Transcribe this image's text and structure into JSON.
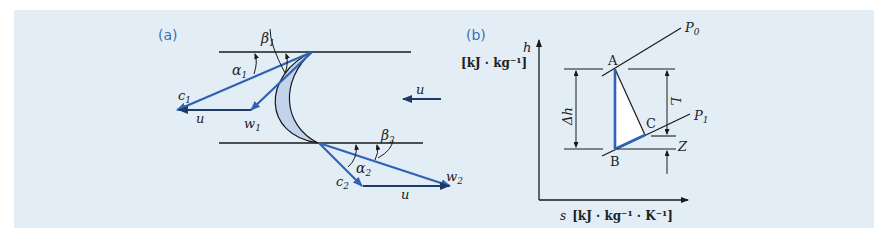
{
  "figure": {
    "background_color": "#e3edf6",
    "vector_color": "#2f62b5",
    "line_color": "#1a1a1a",
    "blade_fill": "#c3d3ea"
  },
  "panel_a": {
    "label": "(a)",
    "title": "Velocity triangles across a turbine blade",
    "labels": {
      "alpha1": "α",
      "alpha1_sub": "1",
      "beta1": "β",
      "beta1_sub": "1",
      "c1": "c",
      "c1_sub": "1",
      "w1": "w",
      "w1_sub": "1",
      "u_inlet": "u",
      "u_blade": "u",
      "beta2": "β",
      "beta2_sub": "2",
      "alpha2": "α",
      "alpha2_sub": "2",
      "c2": "c",
      "c2_sub": "2",
      "w2": "w",
      "w2_sub": "2",
      "u_outlet": "u"
    }
  },
  "panel_b": {
    "label": "(b)",
    "title": "h–s diagram of expansion",
    "y_axis": {
      "symbol": "h",
      "unit": "[kJ · kg⁻¹]"
    },
    "x_axis": {
      "symbol": "s",
      "unit": "[kJ · kg⁻¹ · K⁻¹]"
    },
    "points": {
      "A": "A",
      "B": "B",
      "C": "C"
    },
    "isobars": {
      "P0": "P",
      "P0_sub": "0",
      "P1": "P",
      "P1_sub": "1"
    },
    "dimensions": {
      "delta_h": "Δh",
      "L": "L",
      "Z": "Z"
    }
  }
}
